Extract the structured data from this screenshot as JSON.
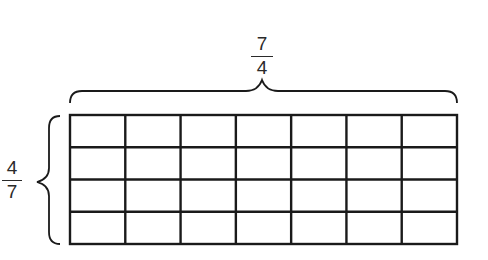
{
  "diagram": {
    "width_label": {
      "numerator": "7",
      "denominator": "4"
    },
    "height_label": {
      "numerator": "4",
      "denominator": "7"
    },
    "grid": {
      "columns": 7,
      "rows": 4
    },
    "stroke_color": "#1a1a1a"
  }
}
